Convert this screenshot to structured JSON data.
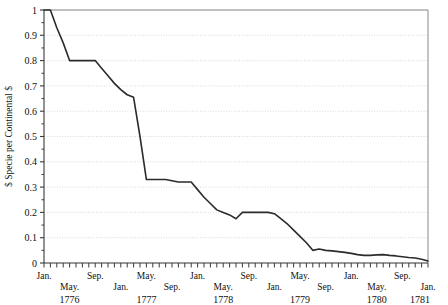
{
  "chart_data": {
    "type": "line",
    "title": "",
    "subtitle": "",
    "xlabel": "",
    "ylabel": "$ Specie per Continental $",
    "ylim": [
      0,
      1
    ],
    "xlim": [
      "Jan. 1776",
      "Jan. 1781"
    ],
    "grid": true,
    "legend": false,
    "y_ticks": [
      "0",
      "0.1",
      "0.2",
      "0.3",
      "0.4",
      "0.5",
      "0.6",
      "0.7",
      "0.8",
      "0.9",
      "1"
    ],
    "y_tick_values": [
      0,
      0.1,
      0.2,
      0.3,
      0.4,
      0.5,
      0.6,
      0.7,
      0.8,
      0.9,
      1
    ],
    "x_tick_labels": [
      {
        "label": "Jan.",
        "month_index": 0,
        "row": "upper"
      },
      {
        "label": "May.",
        "month_index": 4,
        "row": "lower"
      },
      {
        "label": "Sep.",
        "month_index": 8,
        "row": "upper"
      },
      {
        "label": "Jan.",
        "month_index": 12,
        "row": "lower"
      },
      {
        "label": "May.",
        "month_index": 16,
        "row": "upper"
      },
      {
        "label": "Sep.",
        "month_index": 20,
        "row": "lower"
      },
      {
        "label": "Jan.",
        "month_index": 24,
        "row": "upper"
      },
      {
        "label": "May.",
        "month_index": 28,
        "row": "lower"
      },
      {
        "label": "Sep.",
        "month_index": 32,
        "row": "upper"
      },
      {
        "label": "Jan.",
        "month_index": 36,
        "row": "lower"
      },
      {
        "label": "May.",
        "month_index": 40,
        "row": "upper"
      },
      {
        "label": "Sep.",
        "month_index": 44,
        "row": "lower"
      },
      {
        "label": "Jan.",
        "month_index": 48,
        "row": "upper"
      },
      {
        "label": "May.",
        "month_index": 52,
        "row": "lower"
      },
      {
        "label": "Sep.",
        "month_index": 56,
        "row": "upper"
      },
      {
        "label": "Jan.",
        "month_index": 60,
        "row": "lower"
      }
    ],
    "year_labels": [
      {
        "label": "1776",
        "month_index": 4
      },
      {
        "label": "1777",
        "month_index": 16
      },
      {
        "label": "1778",
        "month_index": 28
      },
      {
        "label": "1779",
        "month_index": 40
      },
      {
        "label": "1780",
        "month_index": 52
      },
      {
        "label": "1781",
        "month_index": 60
      }
    ],
    "n_months": 61,
    "x": [
      0,
      1,
      2,
      3,
      4,
      5,
      6,
      7,
      8,
      9,
      10,
      11,
      12,
      13,
      14,
      15,
      16,
      17,
      18,
      19,
      20,
      21,
      22,
      23,
      24,
      25,
      26,
      27,
      28,
      29,
      30,
      31,
      32,
      33,
      34,
      35,
      36,
      37,
      38,
      39,
      40,
      41,
      42,
      43,
      44,
      45,
      46,
      47,
      48,
      49,
      50,
      51,
      52,
      53,
      54,
      55,
      56,
      57,
      58,
      59,
      60
    ],
    "values": [
      1.0,
      1.0,
      0.93,
      0.87,
      0.8,
      0.8,
      0.8,
      0.8,
      0.8,
      0.77,
      0.74,
      0.71,
      0.685,
      0.665,
      0.655,
      0.5,
      0.33,
      0.33,
      0.33,
      0.33,
      0.325,
      0.32,
      0.32,
      0.32,
      0.29,
      0.26,
      0.235,
      0.21,
      0.2,
      0.19,
      0.175,
      0.2,
      0.2,
      0.2,
      0.2,
      0.2,
      0.195,
      0.175,
      0.155,
      0.13,
      0.105,
      0.08,
      0.05,
      0.055,
      0.05,
      0.048,
      0.045,
      0.042,
      0.038,
      0.033,
      0.03,
      0.03,
      0.032,
      0.033,
      0.03,
      0.028,
      0.025,
      0.022,
      0.02,
      0.015,
      0.008
    ],
    "series_color": "#2b2b2b",
    "grid_color": "#cfcfcf",
    "axis_color": "#7a7a7a",
    "background": "#ffffff"
  },
  "plot_geometry": {
    "left": 44,
    "right": 428,
    "top": 10,
    "bottom": 263
  }
}
